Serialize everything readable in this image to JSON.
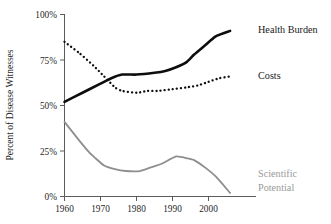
{
  "chart_data": {
    "type": "line",
    "title": "",
    "xlabel": "",
    "ylabel": "Percent of Disease Witnesses",
    "xlim": [
      1960,
      2006
    ],
    "ylim": [
      0,
      100
    ],
    "grid": false,
    "legend_position": "inline-right-end-labels",
    "x_tick_labels": [
      "1960",
      "1970",
      "1980",
      "1990",
      "2000"
    ],
    "x_ticks": [
      1960,
      1970,
      1980,
      1990,
      2000
    ],
    "y_tick_labels": [
      "0%",
      "25%",
      "50%",
      "75%",
      "100%"
    ],
    "y_ticks": [
      0,
      25,
      50,
      75,
      100
    ],
    "series": [
      {
        "name": "Health Burden",
        "style": "solid-thick-black",
        "color": "#0d0d0d",
        "label_x": 2007,
        "label_y": 93,
        "x": [
          1960,
          1965,
          1970,
          1973,
          1976,
          1980,
          1985,
          1988,
          1991,
          1994,
          1996,
          1999,
          2002,
          2006
        ],
        "values": [
          52,
          57,
          62,
          65,
          67,
          67,
          68,
          69,
          71,
          74,
          78,
          83,
          88,
          91
        ]
      },
      {
        "name": "Costs",
        "style": "dotted-black",
        "color": "#0d0d0d",
        "label_x": 2007,
        "label_y": 66,
        "x": [
          1960,
          1964,
          1968,
          1971,
          1974,
          1976,
          1980,
          1983,
          1986,
          1990,
          1994,
          1997,
          2000,
          2003,
          2006
        ],
        "values": [
          85,
          79,
          72,
          66,
          60,
          58,
          57,
          58,
          58,
          59,
          60,
          61,
          63,
          65,
          66
        ]
      },
      {
        "name": "Scientific Potential",
        "style": "solid-gray",
        "color": "#8e8e8e",
        "label_x": 2007,
        "label_y": 12,
        "label_lines": [
          "Scientific",
          "Potential"
        ],
        "x": [
          1960,
          1964,
          1967,
          1971,
          1974,
          1977,
          1981,
          1984,
          1987,
          1991,
          1994,
          1996,
          1999,
          2002,
          2006
        ],
        "values": [
          41,
          31,
          24,
          17,
          15,
          14,
          14,
          16,
          18,
          22,
          21,
          20,
          16,
          11,
          2
        ]
      }
    ]
  },
  "labels": {
    "y_axis_title": "Percent of Disease Witnesses",
    "health_burden": "Health Burden",
    "costs": "Costs",
    "scientific": "Scientific",
    "potential": "Potential",
    "y_0": "0%",
    "y_25": "25%",
    "y_50": "50%",
    "y_75": "75%",
    "y_100": "100%",
    "x_1960": "1960",
    "x_1970": "1970",
    "x_1980": "1980",
    "x_1990": "1990",
    "x_2000": "2000"
  }
}
